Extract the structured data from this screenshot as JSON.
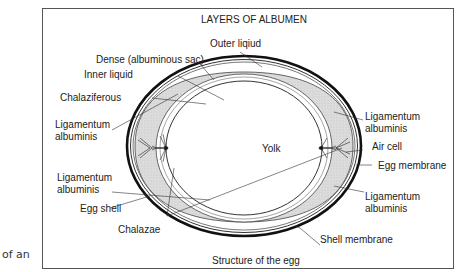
{
  "side_text": "of an",
  "figure": {
    "title": "LAYERS OF ALBUMEN",
    "caption": "Structure of the egg",
    "center_label": "Yolk",
    "labels": {
      "outer_liquid": "Outer liqiud",
      "dense": "Dense (albuminous sac)",
      "inner_liquid": "Inner liquid",
      "chalaziferous": "Chalaziferous",
      "lig_left_top_1": "Ligamentum",
      "lig_left_top_2": "albuminis",
      "lig_left_bot_1": "Ligamentum",
      "lig_left_bot_2": "albuminis",
      "egg_shell": "Egg shell",
      "chalazae": "Chalazae",
      "lig_right_top_1": "Ligamentum",
      "lig_right_top_2": "albuminis",
      "air_cell": "Air cell",
      "egg_membrane": "Egg membrane",
      "lig_right_bot_1": "Ligamentum",
      "lig_right_bot_2": "albuminis",
      "shell_membrane": "Shell membrane"
    }
  }
}
